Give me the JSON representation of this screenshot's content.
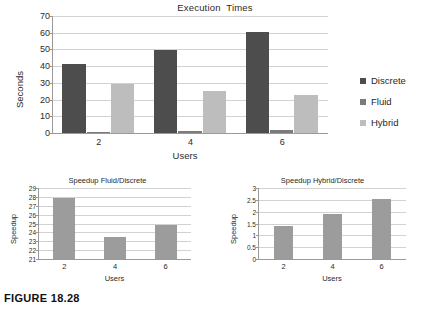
{
  "figure": {
    "caption": "FIGURE 18.28"
  },
  "colors": {
    "discrete": "#4d4d4d",
    "fluid": "#7b7b7b",
    "hybrid": "#bdbdbd",
    "subbar": "#9c9c9c",
    "grid": "#d2d2d2",
    "axis": "#9a9a9a"
  },
  "legend": {
    "position": "right",
    "items": [
      {
        "label": "Discrete",
        "color": "#4d4d4d"
      },
      {
        "label": "Fluid",
        "color": "#7b7b7b"
      },
      {
        "label": "Hybrid",
        "color": "#bdbdbd"
      }
    ]
  },
  "chart_data": [
    {
      "id": "execution-times",
      "type": "bar",
      "title": "Execution  Times",
      "xlabel": "Users",
      "ylabel": "Seconds",
      "categories": [
        "2",
        "4",
        "6"
      ],
      "yticks": [
        0,
        10,
        20,
        30,
        40,
        50,
        60,
        70
      ],
      "ylim": [
        0,
        70
      ],
      "grid": true,
      "legend": "right",
      "series": [
        {
          "name": "Discrete",
          "color": "#4d4d4d",
          "values": [
            41.5,
            49.5,
            60.5
          ]
        },
        {
          "name": "Fluid",
          "color": "#7b7b7b",
          "values": [
            0.9,
            1.5,
            1.8
          ]
        },
        {
          "name": "Hybrid",
          "color": "#bdbdbd",
          "values": [
            29.5,
            25.0,
            23.0
          ]
        }
      ]
    },
    {
      "id": "speedup-fluid-discrete",
      "type": "bar",
      "title": "Speedup Fluid/Discrete",
      "xlabel": "Users",
      "ylabel": "Speedup",
      "categories": [
        "2",
        "4",
        "6"
      ],
      "yticks": [
        21,
        22,
        23,
        24,
        25,
        26,
        27,
        28,
        29
      ],
      "ylim": [
        21,
        29
      ],
      "grid": true,
      "series": [
        {
          "name": "Speedup Fluid/Discrete",
          "color": "#9c9c9c",
          "values": [
            27.9,
            23.5,
            24.8
          ]
        }
      ]
    },
    {
      "id": "speedup-hybrid-discrete",
      "type": "bar",
      "title": "Speedup Hybrid/Discrete",
      "xlabel": "Users",
      "ylabel": "Speedup",
      "categories": [
        "2",
        "4",
        "6"
      ],
      "yticks": [
        0,
        0.5,
        1,
        1.5,
        2,
        2.5,
        3
      ],
      "ytick_labels": [
        "0",
        "0.5",
        "1",
        "1.5",
        "2",
        "2.5",
        "3"
      ],
      "ylim": [
        0,
        3
      ],
      "grid": true,
      "series": [
        {
          "name": "Speedup Hybrid/Discrete",
          "color": "#9c9c9c",
          "values": [
            1.4,
            1.92,
            2.53
          ]
        }
      ]
    }
  ]
}
